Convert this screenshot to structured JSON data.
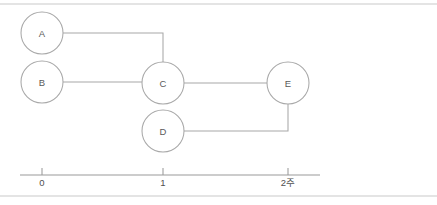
{
  "diagram": {
    "type": "activity-network",
    "title": "",
    "colors": {
      "node_stroke": "#a8a8a8",
      "node_fill": "#ffffff",
      "edge_stroke": "#a8a8a8",
      "axis_stroke": "#9a9a9a",
      "frame_stroke": "#c9c9c9",
      "text": "#5a5a5a"
    },
    "nodes": [
      {
        "id": "A",
        "label": "A",
        "cx": 42,
        "cy": 33,
        "r": 21
      },
      {
        "id": "B",
        "label": "B",
        "cx": 42,
        "cy": 82,
        "r": 21
      },
      {
        "id": "C",
        "label": "C",
        "cx": 163,
        "cy": 83,
        "r": 21
      },
      {
        "id": "D",
        "label": "D",
        "cx": 163,
        "cy": 131,
        "r": 21
      },
      {
        "id": "E",
        "label": "E",
        "cx": 288,
        "cy": 83,
        "r": 21
      }
    ],
    "edges": [
      {
        "id": "edge-a-c",
        "from": "A",
        "to": "C",
        "points": "63,33 163,33 163,62"
      },
      {
        "id": "edge-b-c",
        "from": "B",
        "to": "C",
        "points": "63,82 142,82"
      },
      {
        "id": "edge-c-e",
        "from": "C",
        "to": "E",
        "points": "184,83 267,83"
      },
      {
        "id": "edge-d-e",
        "from": "D",
        "to": "E",
        "points": "184,131 288,131 288,104"
      }
    ],
    "axis": {
      "y": 175,
      "x_start": 20,
      "x_end": 320,
      "tick_height": 7,
      "ticks": [
        {
          "value": "0",
          "label": "0",
          "x": 42
        },
        {
          "value": "1",
          "label": "1",
          "x": 163
        },
        {
          "value": "2",
          "label": "2주",
          "x": 288
        }
      ]
    },
    "frame": {
      "top_y": 4,
      "bottom_y": 196,
      "left_x": 0,
      "right_x": 437
    }
  }
}
